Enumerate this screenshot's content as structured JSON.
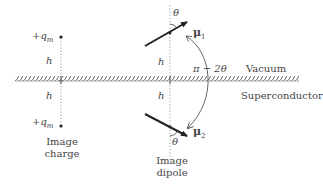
{
  "diagram": {
    "regions": {
      "upper": "Vacuum",
      "lower": "Superconductor"
    },
    "image_charge": {
      "label_line1": "Image",
      "label_line2": "charge",
      "top_charge": "+q",
      "top_charge_sub": "m",
      "bottom_charge": "+q",
      "bottom_charge_sub": "m",
      "upper_distance": "h",
      "lower_distance": "h"
    },
    "image_dipole": {
      "label_line1": "Image",
      "label_line2": "dipole",
      "upper_moment": "μ",
      "upper_moment_sub": "1",
      "lower_moment": "μ",
      "lower_moment_sub": "2",
      "upper_angle": "θ",
      "lower_angle": "θ",
      "upper_distance": "h",
      "lower_distance": "h",
      "arc_angle": "π − 2θ"
    },
    "colors": {
      "ink": "#333333",
      "surface": "#555555",
      "dotted": "#999999"
    }
  }
}
